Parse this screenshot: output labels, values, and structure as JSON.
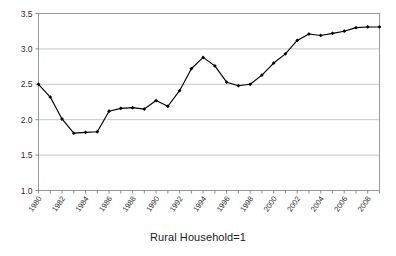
{
  "chart_data": {
    "type": "line",
    "title": "",
    "xlabel": "Rural Household=1",
    "ylabel": "",
    "ylim": [
      1.0,
      3.5
    ],
    "xlim": [
      1980,
      2009
    ],
    "grid": true,
    "legend": false,
    "y_ticks": [
      "1.0",
      "1.5",
      "2.0",
      "2.5",
      "3.0",
      "3.5"
    ],
    "y_tick_values": [
      1.0,
      1.5,
      2.0,
      2.5,
      3.0,
      3.5
    ],
    "x_tick_labels": [
      "1980",
      "1982",
      "1984",
      "1986",
      "1988",
      "1990",
      "1992",
      "1994",
      "1996",
      "1998",
      "2000",
      "2002",
      "2004",
      "2006",
      "2008"
    ],
    "x_tick_values": [
      1980,
      1982,
      1984,
      1986,
      1988,
      1990,
      1992,
      1994,
      1996,
      1998,
      2000,
      2002,
      2004,
      2006,
      2008
    ],
    "x": [
      1980,
      1981,
      1982,
      1983,
      1984,
      1985,
      1986,
      1987,
      1988,
      1989,
      1990,
      1991,
      1992,
      1993,
      1994,
      1995,
      1996,
      1997,
      1998,
      1999,
      2000,
      2001,
      2002,
      2003,
      2004,
      2005,
      2006,
      2007,
      2008,
      2009
    ],
    "values": [
      2.5,
      2.32,
      2.01,
      1.81,
      1.82,
      1.83,
      2.12,
      2.16,
      2.17,
      2.15,
      2.27,
      2.19,
      2.41,
      2.72,
      2.88,
      2.76,
      2.53,
      2.48,
      2.5,
      2.63,
      2.8,
      2.93,
      3.12,
      3.21,
      3.19,
      3.22,
      3.25,
      3.3,
      3.31,
      3.31
    ],
    "series_name": "Rural Household=1",
    "marker": "diamond",
    "line_color": "#000000",
    "marker_color": "#000000"
  },
  "axis": {
    "title_text": "Rural Household=1"
  }
}
